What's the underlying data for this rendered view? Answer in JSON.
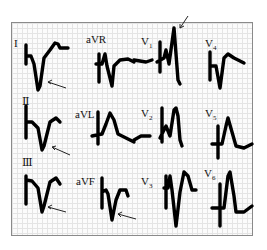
{
  "figure": {
    "leads": [
      {
        "id": "I",
        "label": "I"
      },
      {
        "id": "II",
        "label": "Ⅱ"
      },
      {
        "id": "III",
        "label": "Ⅲ"
      },
      {
        "id": "aVR",
        "label": "aVR"
      },
      {
        "id": "aVL",
        "label": "aVL"
      },
      {
        "id": "aVF",
        "label": "aVF"
      },
      {
        "id": "V1",
        "label": "V",
        "sub": "1"
      },
      {
        "id": "V2",
        "label": "V",
        "sub": "2"
      },
      {
        "id": "V3",
        "label": "V",
        "sub": "3"
      },
      {
        "id": "V4",
        "label": "V",
        "sub": "4"
      },
      {
        "id": "V5",
        "label": "V",
        "sub": "5"
      },
      {
        "id": "V6",
        "label": "V",
        "sub": "6"
      }
    ],
    "annotations": [
      {
        "lead": "I",
        "type": "arrow"
      },
      {
        "lead": "II",
        "type": "arrow"
      },
      {
        "lead": "III",
        "type": "arrow"
      },
      {
        "lead": "aVF",
        "type": "arrow"
      },
      {
        "lead": "V1",
        "type": "arrow"
      }
    ],
    "colors": {
      "trace": "#000000",
      "grid": "#e4e4e4",
      "border": "#8a8a8a"
    }
  }
}
